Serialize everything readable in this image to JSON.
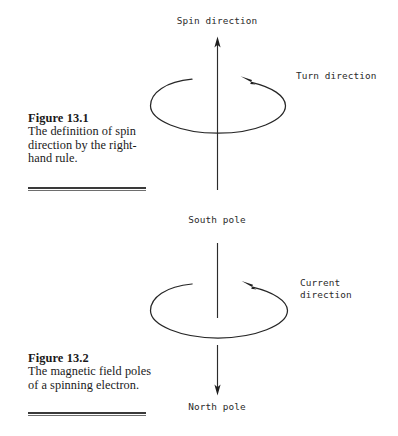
{
  "page": {
    "width": 398,
    "height": 436,
    "background": "#ffffff",
    "ink": "#262626"
  },
  "figures": [
    {
      "id": "figure-13-1",
      "caption_title": "Figure 13.1",
      "caption_body": "The definition of spin direction by the right-hand rule.",
      "labels": {
        "axis_top": "Spin direction",
        "rotation": "Turn direction",
        "axis_bottom": "South pole"
      }
    },
    {
      "id": "figure-13-2",
      "caption_title": "Figure 13.2",
      "caption_body": "The magnetic field poles of a spinning electron.",
      "labels": {
        "axis_top": "South pole",
        "rotation": "Current\ndirection",
        "axis_bottom": "North pole"
      }
    }
  ],
  "diagram": {
    "upper": {
      "axis_label_top": "Spin direction",
      "axis_label_bottom": "South pole",
      "rotation_label": "Turn direction",
      "axis_arrow_direction": "up",
      "rotation_arrow_direction": "counterclockwise-viewed-from-top"
    },
    "lower": {
      "axis_label_top": "South pole",
      "axis_label_bottom": "North pole",
      "rotation_label_line1": "Current",
      "rotation_label_line2": "direction",
      "axis_arrow_direction": "down",
      "rotation_arrow_direction": "counterclockwise-viewed-from-top"
    }
  }
}
